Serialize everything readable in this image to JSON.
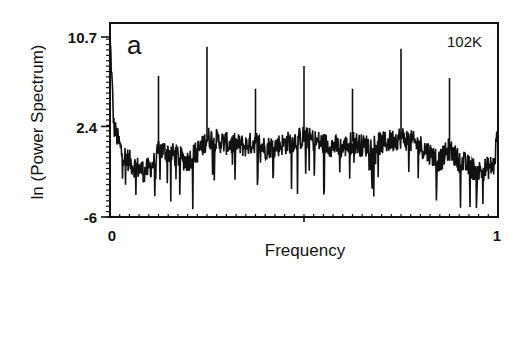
{
  "chart_data": {
    "type": "line",
    "title": "",
    "panel_label": "a",
    "annotation": "102K",
    "xlabel": "Frequency",
    "ylabel": "ln (Power Spectrum)",
    "xlim": [
      0,
      1
    ],
    "ylim": [
      -6,
      10.7
    ],
    "x_ticks": [
      {
        "value": 0,
        "label": "0"
      },
      {
        "value": 1,
        "label": "1"
      }
    ],
    "y_ticks": [
      {
        "value": 10.7,
        "label": "10.7"
      },
      {
        "value": 2.4,
        "label": "2.4"
      },
      {
        "value": -6,
        "label": "-6"
      }
    ],
    "grid": false,
    "legend": null,
    "series": [
      {
        "name": "Power spectrum (noisy background)",
        "description": "Dense noisy baseline around ln ~ -1 to 2, with broad humps near commensurate frequencies; dips down to about -5.5",
        "x": [
          0.0,
          0.01,
          0.03,
          0.06,
          0.09,
          0.12,
          0.125,
          0.15,
          0.2,
          0.24,
          0.25,
          0.3,
          0.35,
          0.375,
          0.4,
          0.45,
          0.5,
          0.55,
          0.6,
          0.625,
          0.65,
          0.7,
          0.75,
          0.8,
          0.85,
          0.875,
          0.9,
          0.95,
          0.99,
          1.0
        ],
        "values": [
          10.7,
          2.4,
          0.0,
          -1.2,
          -1.8,
          -0.8,
          0.3,
          0.0,
          -0.8,
          0.6,
          1.4,
          0.8,
          0.6,
          1.0,
          0.4,
          0.8,
          1.4,
          0.8,
          0.4,
          1.0,
          0.6,
          0.8,
          1.4,
          0.6,
          -0.8,
          0.3,
          -0.8,
          -1.8,
          -1.2,
          2.4
        ]
      },
      {
        "name": "Sharp peaks",
        "x": [
          0.125,
          0.25,
          0.375,
          0.5,
          0.625,
          0.75,
          0.875
        ],
        "values": [
          7.1,
          9.8,
          5.9,
          8.0,
          5.9,
          9.6,
          6.9
        ]
      }
    ]
  }
}
